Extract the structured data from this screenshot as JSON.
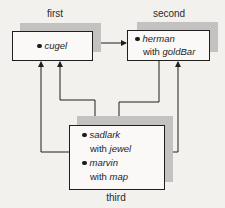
{
  "diagram": {
    "nodes": [
      {
        "id": "first",
        "caption": "first",
        "entries": [
          {
            "name": "cugel",
            "with_prefix": "",
            "with_item": ""
          }
        ]
      },
      {
        "id": "second",
        "caption": "second",
        "entries": [
          {
            "name": "herman",
            "with_prefix": "with ",
            "with_item": "goldBar"
          }
        ]
      },
      {
        "id": "third",
        "caption": "third",
        "entries": [
          {
            "name": "sadlark",
            "with_prefix": "with ",
            "with_item": "jewel"
          },
          {
            "name": "marvin",
            "with_prefix": "with ",
            "with_item": "map"
          }
        ]
      }
    ],
    "edges": [
      {
        "from": "first",
        "to": "second"
      },
      {
        "from": "third",
        "to": "first"
      },
      {
        "from": "first",
        "to": "third"
      },
      {
        "from": "second",
        "to": "third"
      },
      {
        "from": "third",
        "to": "second"
      }
    ],
    "colors": {
      "background": "#f3f1ee",
      "box_fill": "#faf9f7",
      "shadow": "#c4c2c0",
      "stroke": "#1f1f1f"
    }
  }
}
